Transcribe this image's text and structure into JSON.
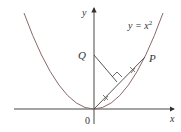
{
  "diagram": {
    "axis_labels": {
      "x": "x",
      "y": "y"
    },
    "origin_label": "0",
    "curve_label": "y = x",
    "curve_exponent": "2",
    "points": {
      "P": "P",
      "Q": "Q"
    },
    "colors": {
      "curve": "#8a6a6a",
      "axis": "#333333",
      "line": "#444444"
    }
  }
}
